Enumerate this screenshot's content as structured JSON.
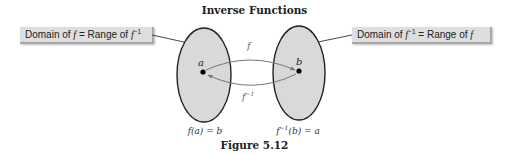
{
  "title": "Inverse Functions",
  "caption": "Figure 5.12",
  "left_box": {
    "prefix": "Domain of ",
    "f1": "f",
    "mid": " = Range of ",
    "f2": "f",
    "sup": "−1"
  },
  "right_box": {
    "prefix": "Domain of ",
    "f1": "f",
    "sup": "−1",
    "mid": " = Range of ",
    "f2": "f"
  },
  "left_set": {
    "point_label": "a",
    "equation": "f(a) = b"
  },
  "right_set": {
    "point_label": "b",
    "equation_prefix": "f",
    "equation_sup": "−1",
    "equation_suffix": "(b) = a"
  },
  "arrows": {
    "forward_label": "f",
    "inverse_label": "f",
    "inverse_sup": "−1"
  },
  "colors": {
    "set_fill": "#d9d9d9",
    "set_stroke": "#222222",
    "arrow": "#777777",
    "box_fill": "#dedede"
  }
}
